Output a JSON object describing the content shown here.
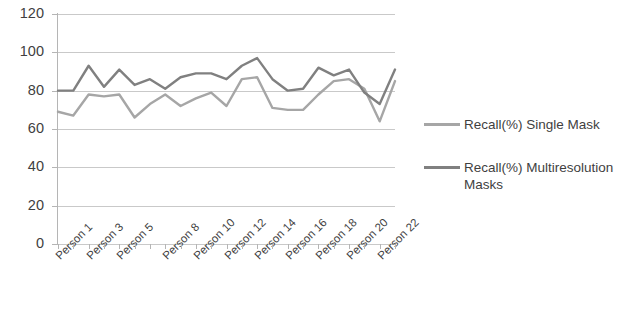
{
  "chart_data": {
    "type": "line",
    "title": "",
    "xlabel": "",
    "ylabel": "",
    "ylim": [
      0,
      120
    ],
    "ytick_step": 20,
    "yticks": [
      0,
      20,
      40,
      60,
      80,
      100,
      120
    ],
    "grid": true,
    "legend_position": "right",
    "categories": [
      "Person 1",
      "Person 2",
      "Person 3",
      "Person 4",
      "Person 5",
      "Person 6",
      "Person 7",
      "Person 8",
      "Person 9",
      "Person 10",
      "Person 11",
      "Person 12",
      "Person 13",
      "Person 14",
      "Person 15",
      "Person 16",
      "Person 17",
      "Person 18",
      "Person 19",
      "Person 20",
      "Person 21",
      "Person 22",
      "Person 23"
    ],
    "visible_tick_labels": [
      "Person 1",
      "Person 3",
      "Person 5",
      "Person 8",
      "Person 10",
      "Person 12",
      "Person 14",
      "Person 16",
      "Person 18",
      "Person 20",
      "Person 22"
    ],
    "series": [
      {
        "name": "Recall(%) Single Mask",
        "color": "#a6a6a6",
        "values": [
          69,
          67,
          78,
          77,
          78,
          66,
          73,
          78,
          72,
          76,
          79,
          72,
          86,
          87,
          71,
          70,
          70,
          78,
          85,
          86,
          81,
          64,
          85
        ]
      },
      {
        "name": "Recall(%) Multiresolution Masks",
        "color": "#808080",
        "values": [
          80,
          80,
          93,
          82,
          91,
          83,
          86,
          81,
          87,
          89,
          89,
          86,
          93,
          97,
          86,
          80,
          81,
          92,
          88,
          91,
          79,
          73,
          91
        ]
      }
    ]
  },
  "legend": {
    "items": [
      {
        "label": "Recall(%) Single Mask",
        "color": "#a6a6a6"
      },
      {
        "label": "Recall(%) Multiresolution Masks",
        "color": "#808080"
      }
    ]
  }
}
